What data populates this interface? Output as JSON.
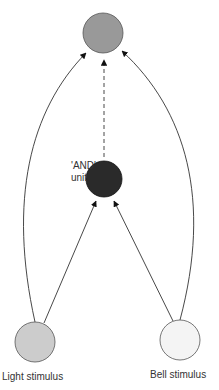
{
  "diagram": {
    "nodes": {
      "output": {
        "label": "",
        "fill": "#999999"
      },
      "and_unit": {
        "label_line1": "'AND'",
        "label_line2": "unit",
        "fill": "#2a2a2a"
      },
      "light": {
        "label": "Light stimulus",
        "fill": "#cccccc"
      },
      "bell": {
        "label": "Bell stimulus",
        "fill": "#f4f4f4"
      }
    },
    "edges": [
      {
        "from": "light",
        "to": "output",
        "style": "solid"
      },
      {
        "from": "bell",
        "to": "output",
        "style": "solid"
      },
      {
        "from": "light",
        "to": "and_unit",
        "style": "solid"
      },
      {
        "from": "bell",
        "to": "and_unit",
        "style": "solid"
      },
      {
        "from": "and_unit",
        "to": "output",
        "style": "dashed"
      }
    ]
  }
}
